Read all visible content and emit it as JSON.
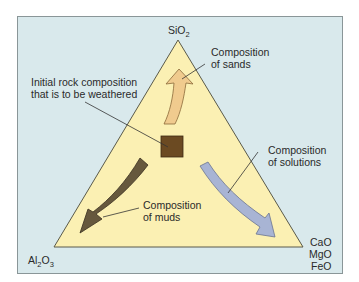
{
  "diagram": {
    "vertices": {
      "top": {
        "formula_base": "SiO",
        "formula_sub": "2"
      },
      "bottom_left": {
        "parts": [
          "Al",
          "2",
          "O",
          "3"
        ]
      },
      "bottom_right": {
        "lines": [
          "CaO",
          "MgO",
          "FeO"
        ]
      }
    },
    "labels": {
      "initial_rock": [
        "Initial rock composition",
        "that is to be weathered"
      ],
      "sands": [
        "Composition",
        "of sands"
      ],
      "solutions": [
        "Composition",
        "of solutions"
      ],
      "muds": [
        "Composition",
        "of muds"
      ]
    },
    "colors": {
      "panel_background": "#d9e9ec",
      "panel_border": "#8a9698",
      "triangle_fill": "#fbf0b3",
      "triangle_stroke": "#5a5a4a",
      "rock_square": "#6b4a22",
      "sand_arrow": "#f0cb8e",
      "mud_arrow": "#66583d",
      "solution_arrow": "#a8b4d4",
      "leader_line": "#333333"
    }
  }
}
